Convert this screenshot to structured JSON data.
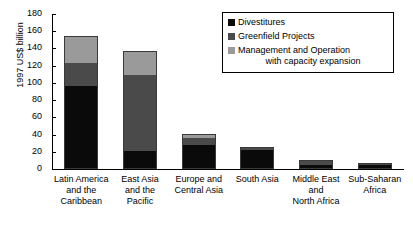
{
  "chart_data": {
    "type": "bar",
    "subtype": "stacked-bar",
    "title": "",
    "xlabel": "",
    "ylabel": "1997 US$ billion",
    "ylim": [
      0,
      180
    ],
    "ytick_step": 20,
    "yticks": [
      180,
      160,
      140,
      120,
      100,
      80,
      60,
      40,
      20,
      0
    ],
    "grid": false,
    "legend_position": "top-right",
    "categories": [
      "Latin America and the Caribbean",
      "East Asia and the Pacific",
      "Europe and Central Asia",
      "South Asia",
      "Middle East and North Africa",
      "Sub-Saharan Africa"
    ],
    "series": [
      {
        "name": "Divestitures",
        "color": "#0a0a0a",
        "values": [
          97,
          20,
          28,
          23,
          4,
          6
        ]
      },
      {
        "name": "Greenfield Projects",
        "color": "#4a4a4a",
        "values": [
          27,
          90,
          9,
          2,
          7,
          1
        ]
      },
      {
        "name": "Management and Operation with capacity expansion",
        "color": "#9a9a9a",
        "values": [
          31,
          27,
          4,
          0,
          0,
          0
        ]
      }
    ],
    "totals": [
      155,
      137,
      41,
      25,
      11,
      7
    ]
  },
  "axis": {
    "y_title": "1997 US$ billion",
    "tick_labels": [
      "180",
      "160",
      "140",
      "120",
      "100",
      "80",
      "60",
      "40",
      "20",
      "0"
    ]
  },
  "categories": [
    {
      "lines": [
        "Latin America",
        "and the",
        "Caribbean"
      ]
    },
    {
      "lines": [
        "East Asia",
        "and the",
        "Pacific"
      ]
    },
    {
      "lines": [
        "Europe and",
        "Central Asia"
      ]
    },
    {
      "lines": [
        "South Asia"
      ]
    },
    {
      "lines": [
        "Middle East",
        "and",
        "North Africa"
      ]
    },
    {
      "lines": [
        "Sub-Saharan",
        "Africa"
      ]
    }
  ],
  "legend": {
    "items": [
      {
        "label": "Divestitures",
        "label2": "",
        "color": "#0a0a0a"
      },
      {
        "label": "Greenfield Projects",
        "label2": "",
        "color": "#4a4a4a"
      },
      {
        "label": "Management and Operation",
        "label2": "with capacity expansion",
        "color": "#9a9a9a"
      }
    ]
  }
}
